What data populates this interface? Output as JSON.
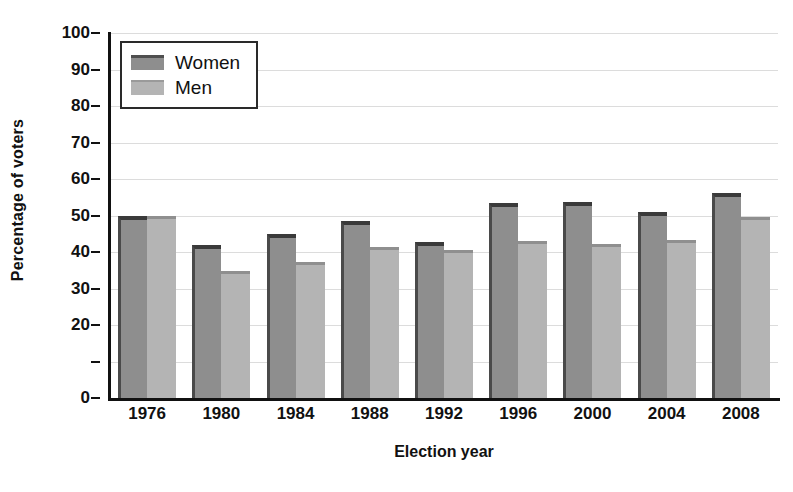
{
  "chart_data": {
    "type": "bar",
    "title": "",
    "subtitle": "",
    "xlabel": "Election year",
    "ylabel": "Percentage of voters",
    "categories": [
      "1976",
      "1980",
      "1984",
      "1988",
      "1992",
      "1996",
      "2000",
      "2004",
      "2008"
    ],
    "series": [
      {
        "name": "Women",
        "color": "#8e8e8e",
        "values": [
          49.8,
          42.0,
          44.8,
          48.5,
          42.8,
          53.5,
          53.8,
          51.0,
          56.3
        ]
      },
      {
        "name": "Men",
        "color": "#b4b4b4",
        "values": [
          49.8,
          34.8,
          37.2,
          41.5,
          40.6,
          43.0,
          42.1,
          43.3,
          49.5
        ]
      }
    ],
    "ylim": [
      0,
      100
    ],
    "y_ticks": [
      0,
      10,
      20,
      30,
      40,
      50,
      60,
      70,
      80,
      90,
      100
    ],
    "y_tick_labels": [
      "0",
      "",
      "20",
      "30",
      "40",
      "50",
      "60",
      "70",
      "80",
      "90",
      "100"
    ],
    "grid": true,
    "grid_axis": "y",
    "legend_position": "upper left",
    "annotations": []
  },
  "legend": {
    "entries": [
      {
        "label": "Women"
      },
      {
        "label": "Men"
      }
    ]
  },
  "colors": {
    "women_bar": "#8e8e8e",
    "men_bar": "#b4b4b4",
    "axis": "#111111",
    "gridline": "#dcdcdc",
    "background": "#ffffff"
  }
}
